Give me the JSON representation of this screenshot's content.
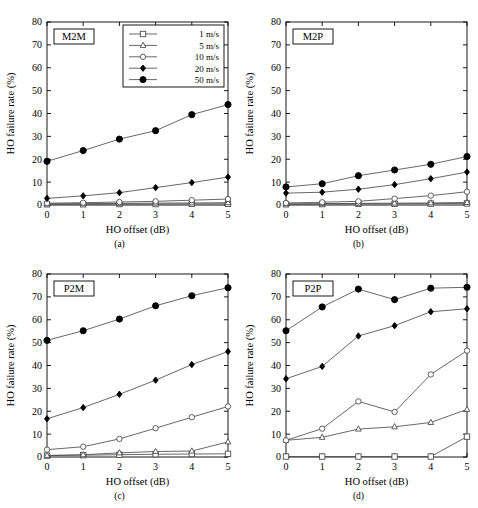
{
  "figure": {
    "width": 478,
    "height": 508,
    "background": "#ffffff",
    "line_color": "#4d4d4d",
    "axis_color": "#000000",
    "grid": false
  },
  "axes": {
    "xlabel": "HO offset (dB)",
    "ylabel": "HO failure rate (%)",
    "xticks": [
      "0",
      "1",
      "2",
      "3",
      "4",
      "5"
    ],
    "yticks": [
      "0",
      "10",
      "20",
      "30",
      "40",
      "50",
      "60",
      "70",
      "80"
    ],
    "xlim": [
      0,
      5
    ],
    "ylim": [
      0,
      80
    ]
  },
  "legend": {
    "visible_in_panel": "a",
    "position": "top-right",
    "entries": [
      {
        "label": "1 m/s",
        "marker": "square",
        "fill": "none"
      },
      {
        "label": "5 m/s",
        "marker": "triangle",
        "fill": "none"
      },
      {
        "label": "10 m/s",
        "marker": "circle",
        "fill": "none"
      },
      {
        "label": "20 m/s",
        "marker": "diamond",
        "fill": "solid"
      },
      {
        "label": "50 m/s",
        "marker": "circle",
        "fill": "solid"
      }
    ]
  },
  "captions": {
    "a": "(a)",
    "b": "(b)",
    "c": "(c)",
    "d": "(d)"
  },
  "chart_data": [
    {
      "type": "line",
      "panel": "a",
      "title": "M2M",
      "caption": "(a)",
      "xlabel": "HO offset (dB)",
      "ylabel": "HO failure rate (%)",
      "x": [
        0,
        1,
        2,
        3,
        4,
        5
      ],
      "xlim": [
        0,
        5
      ],
      "ylim": [
        0,
        80
      ],
      "grid": false,
      "legend": "top-right",
      "series": [
        {
          "name": "1 m/s",
          "marker": "square",
          "fill": "none",
          "values": [
            0.3,
            0.3,
            0.4,
            0.4,
            0.5,
            0.5
          ]
        },
        {
          "name": "5 m/s",
          "marker": "triangle",
          "fill": "none",
          "values": [
            0.5,
            0.6,
            0.7,
            0.8,
            0.9,
            1.0
          ]
        },
        {
          "name": "10 m/s",
          "marker": "circle",
          "fill": "none",
          "values": [
            0.8,
            1.0,
            1.3,
            1.6,
            2.1,
            2.6
          ]
        },
        {
          "name": "20 m/s",
          "marker": "diamond",
          "fill": "solid",
          "values": [
            2.9,
            4.0,
            5.4,
            7.6,
            9.8,
            12.2
          ]
        },
        {
          "name": "50 m/s",
          "marker": "circle",
          "fill": "solid",
          "values": [
            19.1,
            23.8,
            28.8,
            32.5,
            39.5,
            43.9
          ]
        }
      ]
    },
    {
      "type": "line",
      "panel": "b",
      "title": "M2P",
      "caption": "(b)",
      "xlabel": "HO offset (dB)",
      "ylabel": "HO failure rate (%)",
      "x": [
        0,
        1,
        2,
        3,
        4,
        5
      ],
      "xlim": [
        0,
        5
      ],
      "ylim": [
        0,
        80
      ],
      "grid": false,
      "legend": "none",
      "series": [
        {
          "name": "1 m/s",
          "marker": "square",
          "fill": "none",
          "values": [
            0.3,
            0.4,
            0.5,
            0.5,
            0.6,
            0.7
          ]
        },
        {
          "name": "5 m/s",
          "marker": "triangle",
          "fill": "none",
          "values": [
            0.5,
            0.6,
            0.7,
            0.8,
            0.9,
            1.1
          ]
        },
        {
          "name": "10 m/s",
          "marker": "circle",
          "fill": "none",
          "values": [
            0.9,
            1.2,
            1.6,
            2.8,
            4.1,
            5.8
          ]
        },
        {
          "name": "20 m/s",
          "marker": "diamond",
          "fill": "solid",
          "values": [
            5.2,
            5.6,
            6.9,
            8.9,
            11.5,
            14.4
          ]
        },
        {
          "name": "50 m/s",
          "marker": "circle",
          "fill": "solid",
          "values": [
            7.9,
            9.3,
            12.8,
            15.3,
            17.8,
            21.2
          ]
        }
      ]
    },
    {
      "type": "line",
      "panel": "c",
      "title": "P2M",
      "caption": "(c)",
      "xlabel": "HO offset (dB)",
      "ylabel": "HO failure rate (%)",
      "x": [
        0,
        1,
        2,
        3,
        4,
        5
      ],
      "xlim": [
        0,
        5
      ],
      "ylim": [
        0,
        80
      ],
      "grid": false,
      "legend": "none",
      "series": [
        {
          "name": "1 m/s",
          "marker": "square",
          "fill": "none",
          "values": [
            0.6,
            0.8,
            1.0,
            1.2,
            1.3,
            1.4
          ]
        },
        {
          "name": "5 m/s",
          "marker": "triangle",
          "fill": "none",
          "values": [
            0.7,
            1.0,
            1.8,
            2.4,
            2.6,
            6.6
          ]
        },
        {
          "name": "10 m/s",
          "marker": "circle",
          "fill": "none",
          "values": [
            3.2,
            4.5,
            7.9,
            12.6,
            17.4,
            22.1
          ]
        },
        {
          "name": "20 m/s",
          "marker": "diamond",
          "fill": "solid",
          "values": [
            16.7,
            21.6,
            27.4,
            33.6,
            40.4,
            46.1
          ]
        },
        {
          "name": "50 m/s",
          "marker": "circle",
          "fill": "solid",
          "values": [
            51.0,
            55.2,
            60.3,
            66.1,
            70.5,
            74.0
          ]
        }
      ]
    },
    {
      "type": "line",
      "panel": "d",
      "title": "P2P",
      "caption": "(d)",
      "xlabel": "HO offset (dB)",
      "ylabel": "HO failure rate (%)",
      "x": [
        0,
        1,
        2,
        3,
        4,
        5
      ],
      "xlim": [
        0,
        5
      ],
      "ylim": [
        0,
        80
      ],
      "grid": false,
      "legend": "none",
      "series": [
        {
          "name": "1 m/s",
          "marker": "square",
          "fill": "none",
          "values": [
            0.2,
            0.2,
            0.2,
            0.2,
            0.2,
            8.9
          ]
        },
        {
          "name": "5 m/s",
          "marker": "triangle",
          "fill": "none",
          "values": [
            7.3,
            8.6,
            12.2,
            13.2,
            15.1,
            20.8
          ]
        },
        {
          "name": "10 m/s",
          "marker": "circle",
          "fill": "none",
          "values": [
            7.3,
            12.4,
            24.3,
            19.7,
            36.1,
            46.5
          ]
        },
        {
          "name": "20 m/s",
          "marker": "diamond",
          "fill": "solid",
          "values": [
            34.2,
            39.6,
            52.9,
            57.4,
            63.5,
            64.8
          ]
        },
        {
          "name": "50 m/s",
          "marker": "circle",
          "fill": "solid",
          "values": [
            55.2,
            65.6,
            73.4,
            68.8,
            73.8,
            74.2
          ]
        }
      ]
    }
  ]
}
